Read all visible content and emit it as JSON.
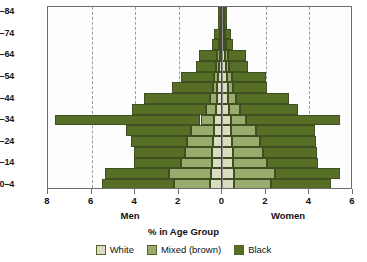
{
  "chart_data": {
    "type": "bar",
    "subtype": "population-pyramid",
    "title": "",
    "xlabel": "% in Age Group",
    "ylabel": "Age Group",
    "grid": true,
    "legend_position": "bottom",
    "left_side_label": "Men",
    "right_side_label": "Women",
    "xlim": [
      -8,
      6
    ],
    "x_ticks": [
      {
        "value": -8,
        "label": "8"
      },
      {
        "value": -6,
        "label": "6"
      },
      {
        "value": -4,
        "label": "4"
      },
      {
        "value": -2,
        "label": "2"
      },
      {
        "value": 0,
        "label": "0"
      },
      {
        "value": 2,
        "label": "2"
      },
      {
        "value": 4,
        "label": "4"
      },
      {
        "value": 6,
        "label": "6"
      }
    ],
    "gridline_values": [
      -6,
      -4,
      -2,
      2,
      4
    ],
    "legend": [
      {
        "name": "White",
        "color": "#d9dcc0"
      },
      {
        "name": "Mixed (brown)",
        "color": "#9aab6e"
      },
      {
        "name": "Black",
        "color": "#566e26"
      }
    ],
    "categories": [
      "0-4",
      "5-9",
      "10-14",
      "15-19",
      "20-24",
      "25-29",
      "30-34",
      "35-39",
      "40-44",
      "45-49",
      "50-54",
      "55-59",
      "60-64",
      "65-69",
      "70-74",
      "75-79",
      "80-84"
    ],
    "visible_y_tick_labels": [
      "0-4",
      "10-14",
      "20-24",
      "30-34",
      "40-44",
      "50-54",
      "60-64",
      "70-74",
      "80-84"
    ],
    "men": {
      "white": [
        0.55,
        0.5,
        0.48,
        0.45,
        0.42,
        0.4,
        0.38,
        0.3,
        0.26,
        0.22,
        0.2,
        0.15,
        0.12,
        0.08,
        0.06,
        0.04,
        0.05
      ],
      "mixed": [
        1.65,
        1.95,
        1.4,
        1.25,
        1.2,
        1.05,
        0.62,
        0.45,
        0.3,
        0.22,
        0.2,
        0.12,
        0.12,
        0.05,
        0.04,
        0.03,
        0.03
      ],
      "black": [
        3.3,
        2.95,
        2.15,
        2.35,
        2.55,
        2.95,
        6.7,
        3.4,
        3.05,
        1.85,
        1.5,
        0.95,
        0.85,
        0.35,
        0.3,
        0.12,
        0.12
      ]
    },
    "women": {
      "white": [
        0.55,
        0.52,
        0.5,
        0.48,
        0.45,
        0.42,
        0.4,
        0.32,
        0.28,
        0.24,
        0.22,
        0.16,
        0.14,
        0.09,
        0.07,
        0.05,
        0.05
      ],
      "mixed": [
        1.7,
        1.9,
        1.55,
        1.4,
        1.3,
        1.15,
        0.7,
        0.5,
        0.35,
        0.25,
        0.22,
        0.14,
        0.14,
        0.06,
        0.05,
        0.03,
        0.03
      ],
      "black": [
        2.75,
        3.0,
        2.35,
        2.45,
        2.55,
        2.7,
        4.3,
        2.65,
        2.45,
        1.55,
        1.55,
        0.9,
        0.8,
        0.35,
        0.3,
        0.12,
        0.12
      ]
    },
    "men_totals": [
      5.5,
      5.4,
      4.03,
      4.05,
      4.17,
      4.4,
      7.7,
      4.15,
      3.61,
      2.29,
      1.9,
      1.22,
      1.09,
      0.48,
      0.4,
      0.19,
      0.2
    ],
    "women_totals": [
      5.0,
      5.42,
      4.4,
      4.33,
      4.3,
      4.27,
      5.4,
      3.47,
      3.08,
      2.04,
      1.99,
      1.2,
      1.08,
      0.5,
      0.42,
      0.2,
      0.2
    ]
  }
}
